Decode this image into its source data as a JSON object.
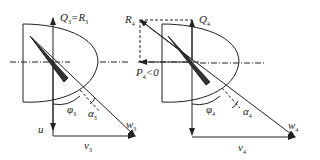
{
  "left_diagram": {
    "top_label": "Q",
    "top_label_sub": "3",
    "top_label_eq": "=R",
    "top_label_eq_sub": "3",
    "phi": "φ",
    "phi_sub": "3",
    "alpha": "α",
    "alpha_sub": "3",
    "w": "w",
    "w_sub": "3",
    "u": "u",
    "v": "v",
    "v_sub": "3"
  },
  "right_diagram": {
    "R": "R",
    "R_sub": "4",
    "Q": "Q",
    "Q_sub": "4",
    "P": "P",
    "P_sub": "4",
    "P_cond": "<0",
    "phi": "φ",
    "phi_sub": "4",
    "alpha": "α",
    "alpha_sub": "4",
    "w": "w",
    "w_sub": "4",
    "v": "v",
    "v_sub": "4"
  }
}
